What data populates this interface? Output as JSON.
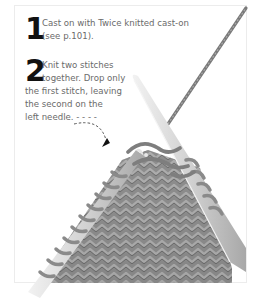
{
  "steps": [
    {
      "number": "1",
      "lines": [
        "Cast on with Twice knitted cast-on",
        "(see p.101)."
      ]
    },
    {
      "number": "2",
      "lines": [
        "Knit two stitches",
        "together. Drop only",
        "the first stitch, leaving",
        "the second on the",
        "left needle. - - - -"
      ]
    }
  ],
  "illustration": {
    "subject": "knitting-needles-herringbone-fabric",
    "colors": {
      "yarn": "#8c8c8c",
      "needle": "#d6d6d6",
      "shadow": "#5e5e5e",
      "frame": "#ececec"
    }
  }
}
